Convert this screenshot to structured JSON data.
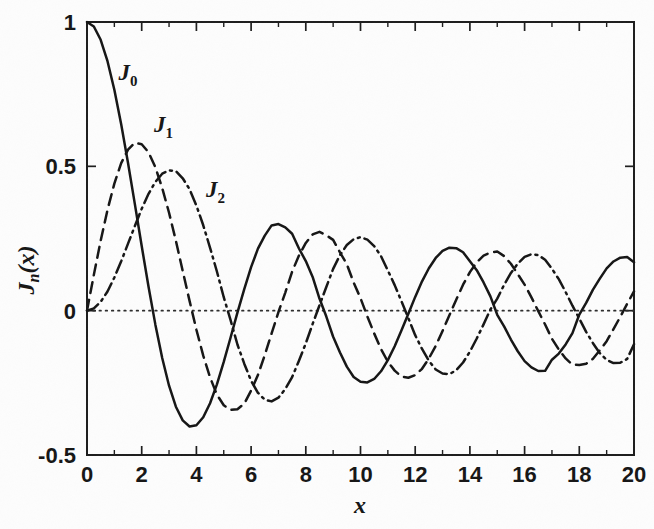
{
  "chart_data": {
    "type": "line",
    "title": "",
    "xlabel": "x",
    "ylabel": "J_n(x)",
    "xlim": [
      0,
      20
    ],
    "ylim": [
      -0.5,
      1
    ],
    "grid": false,
    "legend_position": "inline-curve-labels",
    "zero_line": true,
    "x_ticks": [
      "0",
      "2",
      "4",
      "6",
      "8",
      "10",
      "12",
      "14",
      "16",
      "18",
      "20"
    ],
    "x_tick_values": [
      0,
      2,
      4,
      6,
      8,
      10,
      12,
      14,
      16,
      18,
      20
    ],
    "x_minor_tick_values": [
      1,
      3,
      5,
      7,
      9,
      11,
      13,
      15,
      17,
      19
    ],
    "y_ticks": [
      "1",
      "0.5",
      "0",
      "-0.5"
    ],
    "y_tick_values": [
      1,
      0.5,
      0,
      -0.5
    ],
    "x": [
      0,
      0.25,
      0.5,
      0.75,
      1,
      1.25,
      1.5,
      1.75,
      2,
      2.25,
      2.5,
      2.75,
      3,
      3.25,
      3.5,
      3.75,
      4,
      4.25,
      4.5,
      4.75,
      5,
      5.25,
      5.5,
      5.75,
      6,
      6.25,
      6.5,
      6.75,
      7,
      7.25,
      7.5,
      7.75,
      8,
      8.25,
      8.5,
      8.75,
      9,
      9.25,
      9.5,
      9.75,
      10,
      10.25,
      10.5,
      10.75,
      11,
      11.25,
      11.5,
      11.75,
      12,
      12.25,
      12.5,
      12.75,
      13,
      13.25,
      13.5,
      13.75,
      14,
      14.25,
      14.5,
      14.75,
      15,
      15.25,
      15.5,
      15.75,
      16,
      16.25,
      16.5,
      16.75,
      17,
      17.25,
      17.5,
      17.75,
      18,
      18.25,
      18.5,
      18.75,
      19,
      19.25,
      19.5,
      19.75,
      20
    ],
    "series": [
      {
        "name": "J_0",
        "label": "J",
        "label_sub": "0",
        "style": "solid",
        "color": "#141414",
        "label_x": 1.15,
        "label_y": 0.8,
        "values": [
          1.0,
          0.98443,
          0.93847,
          0.86424,
          0.7652,
          0.64593,
          0.51183,
          0.36903,
          0.22389,
          0.08275,
          -0.04838,
          -0.16414,
          -0.26005,
          -0.33275,
          -0.38013,
          -0.4014,
          -0.39715,
          -0.36915,
          -0.32054,
          -0.2551,
          -0.1776,
          -0.09284,
          -0.00684,
          0.07429,
          0.15065,
          0.21478,
          0.26009,
          0.29536,
          0.30008,
          0.28858,
          0.26634,
          0.21541,
          0.17165,
          0.11706,
          0.04194,
          -0.02043,
          -0.09033,
          -0.14493,
          -0.19393,
          -0.22962,
          -0.24594,
          -0.24878,
          -0.23665,
          -0.21001,
          -0.17119,
          -0.12315,
          -0.06804,
          -0.01066,
          0.04769,
          0.10161,
          0.14688,
          0.18266,
          0.20693,
          0.21829,
          0.21662,
          0.20254,
          0.17108,
          0.14033,
          0.0977,
          0.04955,
          -0.01422,
          -0.05428,
          -0.09992,
          -0.14058,
          -0.1749,
          -0.19654,
          -0.20898,
          -0.20832,
          -0.16985,
          -0.14865,
          -0.1169,
          -0.0777,
          -0.01336,
          0.02685,
          0.07274,
          0.11113,
          0.1466,
          0.17036,
          0.18348,
          0.18548,
          0.16755
        ]
      },
      {
        "name": "J_1",
        "label": "J",
        "label_sub": "1",
        "style": "dashed",
        "color": "#141414",
        "label_x": 2.45,
        "label_y": 0.62,
        "values": [
          0.0,
          0.12403,
          0.24227,
          0.34913,
          0.44005,
          0.51121,
          0.55794,
          0.58152,
          0.57672,
          0.54862,
          0.49709,
          0.42469,
          0.33906,
          0.24226,
          0.13738,
          0.03387,
          -0.06604,
          -0.15584,
          -0.23106,
          -0.29113,
          -0.32758,
          -0.34362,
          -0.34144,
          -0.32228,
          -0.27668,
          -0.22297,
          -0.15384,
          -0.07885,
          -0.00468,
          0.06252,
          0.13525,
          0.19109,
          0.23464,
          0.26407,
          0.27312,
          0.26095,
          0.24531,
          0.20163,
          0.16126,
          0.09712,
          0.04347,
          -0.01977,
          -0.07885,
          -0.13295,
          -0.17679,
          -0.20768,
          -0.22837,
          -0.23228,
          -0.22345,
          -0.20136,
          -0.16549,
          -0.1222,
          -0.07032,
          -0.01607,
          0.03804,
          0.08998,
          0.13338,
          0.16758,
          0.19072,
          0.20136,
          0.20511,
          0.18898,
          0.16241,
          0.12684,
          0.0904,
          0.04606,
          -0.00166,
          -0.04794,
          -0.09767,
          -0.13464,
          -0.16549,
          -0.187,
          -0.188,
          -0.18404,
          -0.16641,
          -0.13713,
          -0.1057,
          -0.06379,
          -0.02108,
          0.02386,
          0.06683
        ]
      },
      {
        "name": "J_2",
        "label": "J",
        "label_sub": "2",
        "style": "dashdot",
        "color": "#141414",
        "label_x": 4.35,
        "label_y": 0.395,
        "values": [
          0.0,
          0.00779,
          0.0306,
          0.06655,
          0.1149,
          0.17109,
          0.23209,
          0.29327,
          0.35283,
          0.40475,
          0.44605,
          0.47437,
          0.48609,
          0.48361,
          0.45863,
          0.42092,
          0.36413,
          0.29583,
          0.21785,
          0.13566,
          0.04657,
          -0.03301,
          -0.11722,
          -0.18362,
          -0.24287,
          -0.28443,
          -0.30851,
          -0.31429,
          -0.30142,
          -0.27151,
          -0.23028,
          -0.17353,
          -0.11299,
          -0.04601,
          0.01844,
          0.08202,
          0.14485,
          0.19256,
          0.22734,
          0.24752,
          0.25463,
          0.24606,
          0.22367,
          0.18884,
          0.13905,
          0.08854,
          0.03202,
          -0.02614,
          -0.08493,
          -0.13262,
          -0.174,
          -0.20366,
          -0.21774,
          -0.2199,
          -0.20616,
          -0.17953,
          -0.14182,
          -0.09652,
          -0.04739,
          0.00403,
          0.04157,
          0.08952,
          0.13072,
          0.16303,
          0.18619,
          0.19567,
          0.19241,
          0.17637,
          0.14518,
          0.10907,
          0.06464,
          0.01719,
          -0.02757,
          -0.07339,
          -0.11268,
          -0.1473,
          -0.17025,
          -0.18145,
          -0.18025,
          -0.16734,
          -0.11605
        ]
      }
    ]
  }
}
